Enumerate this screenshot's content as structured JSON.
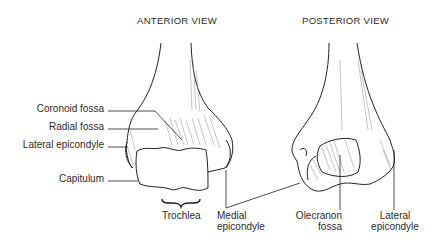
{
  "views": {
    "anterior": {
      "title": "ANTERIOR VIEW",
      "labels": {
        "coronoid_fossa": "Coronoid fossa",
        "radial_fossa": "Radial fossa",
        "lateral_epicondyle": "Lateral epicondyle",
        "capitulum": "Capitulum",
        "trochlea": "Trochlea"
      }
    },
    "shared": {
      "medial_epicondyle_line1": "Medial",
      "medial_epicondyle_line2": "epicondyle"
    },
    "posterior": {
      "title": "POSTERIOR VIEW",
      "labels": {
        "olecranon_fossa_line1": "Olecranon",
        "olecranon_fossa_line2": "fossa",
        "lateral_epicondyle_line1": "Lateral",
        "lateral_epicondyle_line2": "epicondyle"
      }
    }
  },
  "colors": {
    "line": "#222222",
    "hatch": "#666666",
    "background": "#ffffff"
  }
}
